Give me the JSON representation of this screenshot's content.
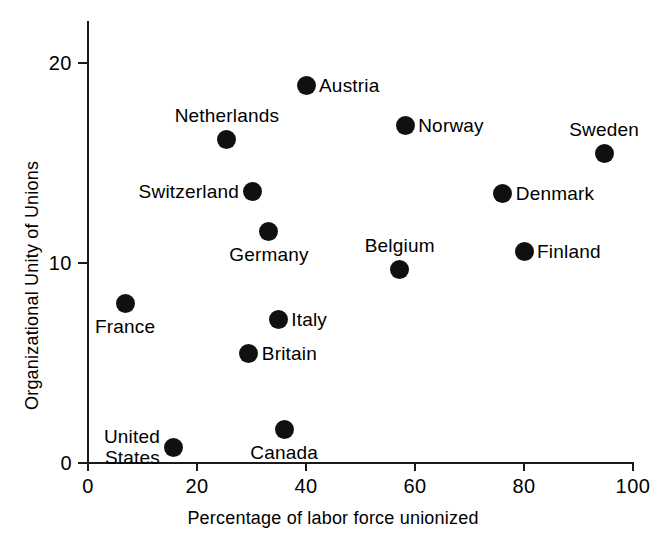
{
  "chart_data": {
    "type": "scatter",
    "title": "",
    "xlabel": "Percentage of labor force unionized",
    "ylabel": "Organizational Unity of Unions",
    "xlim": [
      0,
      100
    ],
    "ylim": [
      0,
      22
    ],
    "xticks": [
      "0",
      "20",
      "40",
      "60",
      "80",
      "100"
    ],
    "xtick_values": [
      0,
      20,
      40,
      60,
      80,
      100
    ],
    "yticks": [
      "0",
      "10",
      "20"
    ],
    "ytick_values": [
      0,
      10,
      20
    ],
    "grid": false,
    "legend": false,
    "marker": "filled-circle",
    "marker_color": "#101010",
    "points": [
      {
        "label": "Austria",
        "x": 40.0,
        "y": 18.9,
        "label_pos": "right"
      },
      {
        "label": "Norway",
        "x": 58.2,
        "y": 16.9,
        "label_pos": "right"
      },
      {
        "label": "Netherlands",
        "x": 25.5,
        "y": 16.2,
        "label_pos": "above"
      },
      {
        "label": "Sweden",
        "x": 94.7,
        "y": 15.5,
        "label_pos": "above"
      },
      {
        "label": "Switzerland",
        "x": 30.1,
        "y": 13.6,
        "label_pos": "left"
      },
      {
        "label": "Denmark",
        "x": 76.1,
        "y": 13.5,
        "label_pos": "right"
      },
      {
        "label": "Germany",
        "x": 33.2,
        "y": 11.6,
        "label_pos": "below"
      },
      {
        "label": "Finland",
        "x": 80.0,
        "y": 10.6,
        "label_pos": "right"
      },
      {
        "label": "Belgium",
        "x": 57.2,
        "y": 9.7,
        "label_pos": "above"
      },
      {
        "label": "France",
        "x": 6.8,
        "y": 8.0,
        "label_pos": "below"
      },
      {
        "label": "Italy",
        "x": 34.9,
        "y": 7.2,
        "label_pos": "right"
      },
      {
        "label": "Britain",
        "x": 29.5,
        "y": 5.5,
        "label_pos": "right"
      },
      {
        "label": "Canada",
        "x": 36.0,
        "y": 1.7,
        "label_pos": "below"
      },
      {
        "label": "United\nStates",
        "x": 15.6,
        "y": 0.8,
        "label_pos": "left"
      }
    ]
  }
}
